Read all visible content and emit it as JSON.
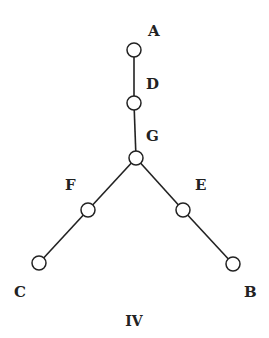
{
  "diagram": {
    "caption": "IV",
    "nodes": [
      {
        "id": "A",
        "label": "A",
        "cx": 134,
        "cy": 50,
        "lx": 148,
        "ly": 36
      },
      {
        "id": "D",
        "label": "D",
        "cx": 134,
        "cy": 103,
        "lx": 146,
        "ly": 89
      },
      {
        "id": "G",
        "label": "G",
        "cx": 136,
        "cy": 158,
        "lx": 146,
        "ly": 141
      },
      {
        "id": "F",
        "label": "F",
        "cx": 88,
        "cy": 210,
        "lx": 65,
        "ly": 190
      },
      {
        "id": "E",
        "label": "E",
        "cx": 183,
        "cy": 210,
        "lx": 195,
        "ly": 190
      },
      {
        "id": "C",
        "label": "C",
        "cx": 39,
        "cy": 263,
        "lx": 14,
        "ly": 297
      },
      {
        "id": "B",
        "label": "B",
        "cx": 233,
        "cy": 264,
        "lx": 244,
        "ly": 297
      }
    ],
    "edges": [
      [
        "A",
        "D"
      ],
      [
        "D",
        "G"
      ],
      [
        "G",
        "F"
      ],
      [
        "F",
        "C"
      ],
      [
        "G",
        "E"
      ],
      [
        "E",
        "B"
      ]
    ]
  }
}
